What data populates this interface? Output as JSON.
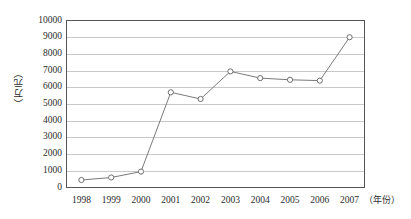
{
  "chart_data": {
    "type": "line",
    "title": "",
    "xlabel": "（年份）",
    "ylabel": "（万元）",
    "categories": [
      "1998",
      "1999",
      "2000",
      "2001",
      "2002",
      "2003",
      "2004",
      "2005",
      "2006",
      "2007"
    ],
    "values": [
      450,
      600,
      950,
      5700,
      5300,
      6950,
      6550,
      6450,
      6400,
      9000
    ],
    "series": [
      {
        "name": "",
        "values": [
          450,
          600,
          950,
          5700,
          5300,
          6950,
          6550,
          6450,
          6400,
          9000
        ]
      }
    ],
    "ylim": [
      0,
      10000
    ],
    "ytick_labels": [
      "0",
      "1000",
      "2000",
      "3000",
      "4000",
      "5000",
      "6000",
      "7000",
      "8000",
      "9000",
      "10000"
    ],
    "ytick_values": [
      0,
      1000,
      2000,
      3000,
      4000,
      5000,
      6000,
      7000,
      8000,
      9000,
      10000
    ],
    "grid": true,
    "grid_axis": "y",
    "legend": false,
    "legend_position": "none",
    "marker": "open-circle",
    "line_color": "#7a7a7a",
    "marker_color": "#6f6f6f",
    "grid_color": "#c9c9c9",
    "axis_color": "#555555",
    "background": "#ffffff"
  }
}
